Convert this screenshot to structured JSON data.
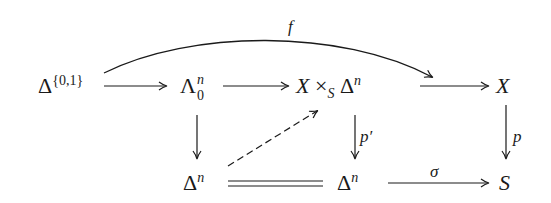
{
  "diagram": {
    "type": "commutative-diagram",
    "nodes": {
      "delta01": {
        "base": "Δ",
        "sup": "{0,1}"
      },
      "horn": {
        "base": "Λ",
        "sup": "n",
        "sub": "0"
      },
      "fiber": {
        "x": "X",
        "times": "×",
        "sub": "S",
        "delta": "Δ",
        "sup": "n"
      },
      "X": {
        "label": "X"
      },
      "deltaN1": {
        "base": "Δ",
        "sup": "n"
      },
      "deltaN2": {
        "base": "Δ",
        "sup": "n"
      },
      "S": {
        "label": "S"
      }
    },
    "arrows": [
      {
        "from": "delta01",
        "to": "X",
        "label": "f",
        "style": "curved"
      },
      {
        "from": "delta01",
        "to": "horn",
        "label": "",
        "style": "solid"
      },
      {
        "from": "horn",
        "to": "fiber",
        "label": "",
        "style": "solid"
      },
      {
        "from": "fiber",
        "to": "X",
        "label": "",
        "style": "solid"
      },
      {
        "from": "horn",
        "to": "deltaN1",
        "label": "",
        "style": "solid"
      },
      {
        "from": "deltaN1",
        "to": "fiber",
        "label": "",
        "style": "dashed"
      },
      {
        "from": "fiber",
        "to": "deltaN2",
        "label": "p′",
        "style": "solid"
      },
      {
        "from": "X",
        "to": "S",
        "label": "p",
        "style": "solid"
      },
      {
        "from": "deltaN1",
        "to": "deltaN2",
        "label": "",
        "style": "equality"
      },
      {
        "from": "deltaN2",
        "to": "S",
        "label": "σ",
        "style": "solid"
      }
    ],
    "labels": {
      "f": "f",
      "p_prime": "p′",
      "p": "p",
      "sigma": "σ"
    }
  }
}
